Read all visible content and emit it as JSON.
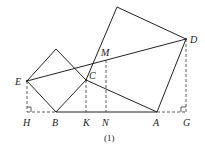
{
  "figure": {
    "caption": "(1)",
    "points": {
      "E": {
        "label": "E",
        "x": 27,
        "y": 81
      },
      "B": {
        "label": "B",
        "x": 56,
        "y": 112
      },
      "C": {
        "label": "C",
        "x": 86,
        "y": 80
      },
      "A": {
        "label": "A",
        "x": 157,
        "y": 112
      },
      "D": {
        "label": "D",
        "x": 186,
        "y": 39
      },
      "M": {
        "label": "M",
        "x": 106,
        "y": 60
      },
      "H": {
        "label": "H",
        "x": 27,
        "y": 112
      },
      "K": {
        "label": "K",
        "x": 86,
        "y": 112
      },
      "N": {
        "label": "N",
        "x": 106,
        "y": 112
      },
      "G": {
        "label": "G",
        "x": 186,
        "y": 112
      }
    },
    "labels": {
      "E": "E",
      "B": "B",
      "C": "C",
      "A": "A",
      "D": "D",
      "M": "M",
      "H": "H",
      "K": "K",
      "N": "N",
      "G": "G"
    },
    "colors": {
      "line": "#222222",
      "background": "#ffffff"
    }
  }
}
